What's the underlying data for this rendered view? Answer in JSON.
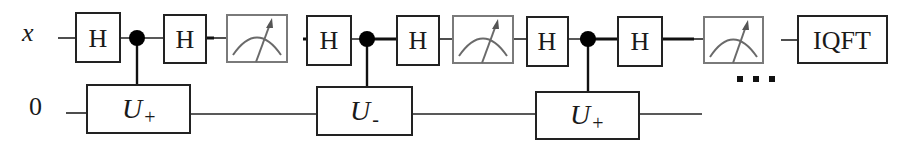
{
  "diagram": {
    "type": "quantum-circuit",
    "qubits": [
      {
        "id": "q0",
        "label": "x",
        "y": 38
      },
      {
        "id": "q1",
        "label": "0",
        "y": 113
      }
    ],
    "gates": [
      {
        "name": "H",
        "qubit": "x",
        "label": "H"
      },
      {
        "name": "controlled-U",
        "control": "x",
        "target": "0",
        "label": "U",
        "subscript": "+"
      },
      {
        "name": "H",
        "qubit": "x",
        "label": "H"
      },
      {
        "name": "measure",
        "qubit": "x"
      },
      {
        "name": "H",
        "qubit": "x",
        "label": "H"
      },
      {
        "name": "controlled-U",
        "control": "x",
        "target": "0",
        "label": "U",
        "subscript": "-"
      },
      {
        "name": "H",
        "qubit": "x",
        "label": "H"
      },
      {
        "name": "measure",
        "qubit": "x"
      },
      {
        "name": "H",
        "qubit": "x",
        "label": "H"
      },
      {
        "name": "controlled-U",
        "control": "x",
        "target": "0",
        "label": "U",
        "subscript": "+"
      },
      {
        "name": "H",
        "qubit": "x",
        "label": "H"
      },
      {
        "name": "measure",
        "qubit": "x"
      },
      {
        "name": "IQFT",
        "qubit": "x",
        "label": "IQFT"
      }
    ],
    "ellipsis": "...",
    "labels": {
      "q_top": "x",
      "q_bottom": "0",
      "h1": "H",
      "h2": "H",
      "h3": "H",
      "h4": "H",
      "h5": "H",
      "h6": "H",
      "u1_main": "U",
      "u1_sub": "+",
      "u2_main": "U",
      "u2_sub": "-",
      "u3_main": "U",
      "u3_sub": "+",
      "iqft": "IQFT"
    },
    "colors": {
      "line": "#222222",
      "meter": "#7a7a7a",
      "background": "#ffffff"
    }
  }
}
